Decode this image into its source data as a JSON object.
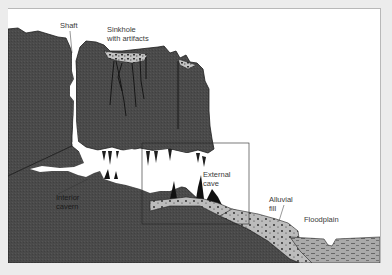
{
  "diagram": {
    "colors": {
      "background": "#ececec",
      "panel": "#ffffff",
      "bedrock": "#4a4a4a",
      "bedrock_outline": "#1e1e1e",
      "fill_sediment": "#b9b9b9",
      "floodplain_water": "#a9a9a9",
      "outline": "#222222"
    },
    "labels": {
      "shaft": "Shaft",
      "sinkhole": "Sinkhole\nwith artifacts",
      "interior_cavern": "Interior\ncavern",
      "external_cave": "External\ncave",
      "alluvial_fill": "Alluvial\nfill",
      "floodplain": "Floodplain"
    }
  }
}
